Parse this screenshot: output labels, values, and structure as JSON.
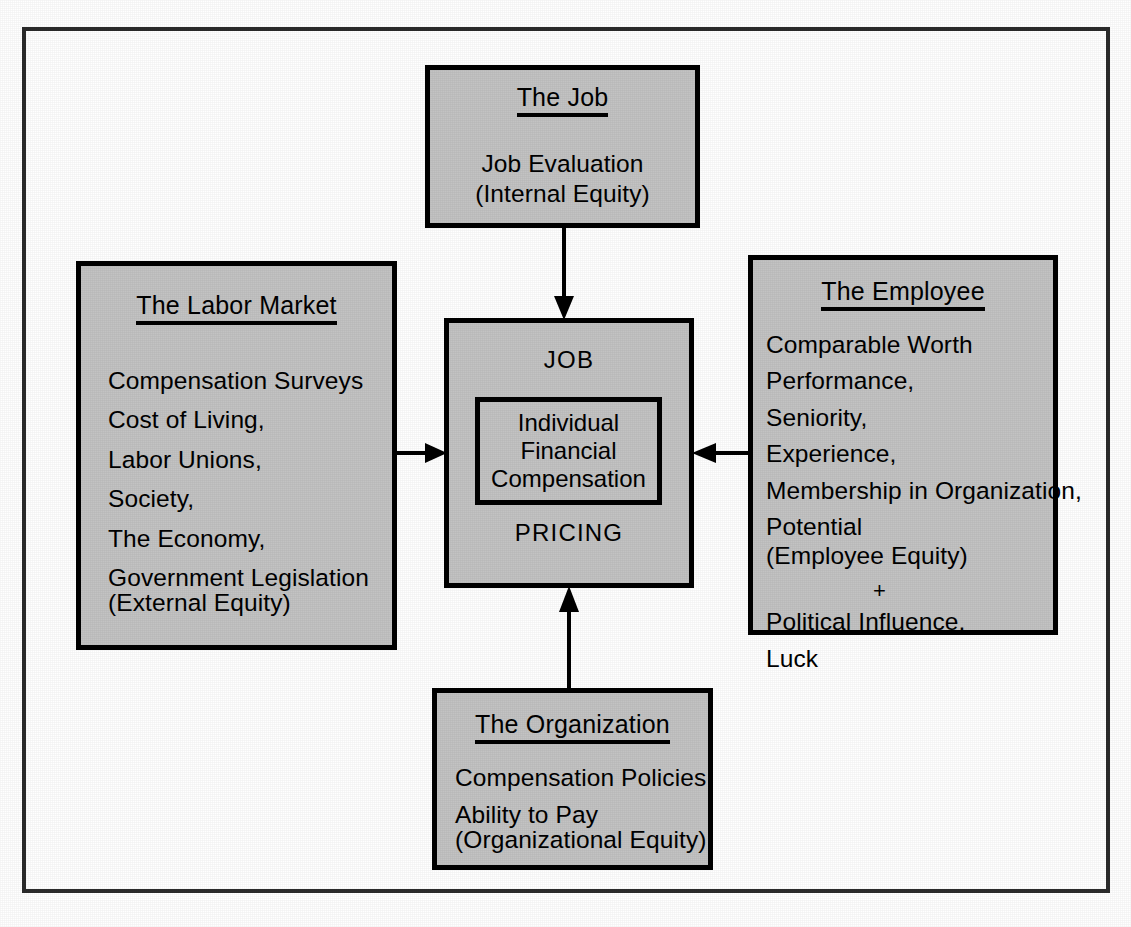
{
  "diagram": {
    "colors": {
      "box_fill": "#c3c3c3",
      "box_border": "#000000",
      "frame_border": "#2b2b2b",
      "page_background": "#ffffff",
      "text": "#000000"
    },
    "nodes": {
      "job": {
        "title": "The Job",
        "lines": [
          "Job Evaluation",
          "(Internal Equity)"
        ]
      },
      "labor_market": {
        "title": "The Labor Market",
        "lines": [
          "Compensation Surveys",
          "Cost of Living,",
          "Labor Unions,",
          "Society,",
          "The Economy,",
          "Government Legislation",
          "(External Equity)"
        ]
      },
      "employee": {
        "title": "The Employee",
        "lines": [
          "Comparable Worth",
          "Performance,",
          "Seniority,",
          "Experience,",
          "Membership in Organization,",
          "Potential",
          "(Employee Equity)",
          "+",
          "Political Influence,",
          "Luck"
        ]
      },
      "organization": {
        "title": "The Organization",
        "lines": [
          "Compensation Policies",
          "Ability to Pay",
          "(Organizational Equity)"
        ]
      },
      "center": {
        "top_label": "JOB",
        "bottom_label": "PRICING",
        "inner_lines": [
          "Individual",
          "Financial",
          "Compensation"
        ]
      }
    },
    "connectors": [
      {
        "name": "job-to-center",
        "from": "job",
        "to": "center",
        "direction": "down"
      },
      {
        "name": "labor-market-to-center",
        "from": "labor_market",
        "to": "center",
        "direction": "right"
      },
      {
        "name": "employee-to-center",
        "from": "employee",
        "to": "center",
        "direction": "left"
      },
      {
        "name": "organization-to-center",
        "from": "organization",
        "to": "center",
        "direction": "up"
      }
    ]
  }
}
